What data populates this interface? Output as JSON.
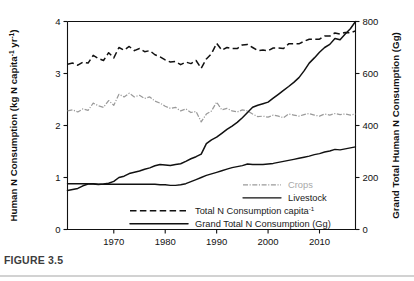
{
  "figure": {
    "caption_label": "FIGURE 3.5"
  },
  "chart_data": {
    "type": "line",
    "title": "",
    "xlabel": "",
    "ylabel": "Human N Consumption (kg N capita-1 yr-1)",
    "ylabel_main": "Human N Consumption (kg N capita",
    "ylabel_sup1": "-1",
    "ylabel_mid": " yr",
    "ylabel_sup2": "-1",
    "ylabel_end": ")",
    "y2label": "Grand Total Human N Consumption (Gg)",
    "xlim": [
      1961,
      2017
    ],
    "ylim": [
      0,
      4
    ],
    "y2lim": [
      0,
      800
    ],
    "xticks": [
      1970,
      1980,
      1990,
      2000,
      2010
    ],
    "yticks": [
      0,
      1,
      2,
      3,
      4
    ],
    "y2ticks": [
      0,
      200,
      400,
      600,
      800
    ],
    "grid": false,
    "legend_position": "inside-lower-right",
    "legend": [
      {
        "label": "Crops",
        "style": "dash-dot",
        "color": "#9a9a9a",
        "muted": true
      },
      {
        "label": "Livestock",
        "style": "solid",
        "color": "#111111",
        "muted": false
      },
      {
        "label": "Total N Consumption capita-1",
        "label_main": "Total N Consumption capita",
        "label_sup": "-1",
        "style": "dashed",
        "color": "#111111",
        "muted": false
      },
      {
        "label": "Grand Total N Consumption (Gg)",
        "label_main": "Grand Total N Consumption (Gg)",
        "label_sup": "",
        "style": "solid-thick",
        "color": "#111111",
        "muted": false
      }
    ],
    "x": [
      1961,
      1962,
      1963,
      1964,
      1965,
      1966,
      1967,
      1968,
      1969,
      1970,
      1971,
      1972,
      1973,
      1974,
      1975,
      1976,
      1977,
      1978,
      1979,
      1980,
      1981,
      1982,
      1983,
      1984,
      1985,
      1986,
      1987,
      1988,
      1989,
      1990,
      1991,
      1992,
      1993,
      1994,
      1995,
      1996,
      1997,
      1998,
      1999,
      2000,
      2001,
      2002,
      2003,
      2004,
      2005,
      2006,
      2007,
      2008,
      2009,
      2010,
      2011,
      2012,
      2013,
      2014,
      2015,
      2016,
      2017
    ],
    "series": [
      {
        "name": "Crops",
        "axis": "left",
        "unit": "kg N capita-1 yr-1",
        "values": [
          2.28,
          2.3,
          2.26,
          2.32,
          2.29,
          2.43,
          2.38,
          2.35,
          2.48,
          2.39,
          2.6,
          2.55,
          2.62,
          2.55,
          2.58,
          2.52,
          2.55,
          2.47,
          2.43,
          2.37,
          2.33,
          2.35,
          2.28,
          2.32,
          2.25,
          2.27,
          2.07,
          2.22,
          2.28,
          2.45,
          2.3,
          2.33,
          2.28,
          2.26,
          2.3,
          2.28,
          2.22,
          2.17,
          2.18,
          2.16,
          2.2,
          2.18,
          2.15,
          2.22,
          2.2,
          2.18,
          2.21,
          2.23,
          2.2,
          2.18,
          2.22,
          2.2,
          2.23,
          2.21,
          2.22,
          2.2,
          2.22
        ]
      },
      {
        "name": "Livestock",
        "axis": "left",
        "unit": "kg N capita-1 yr-1",
        "values": [
          0.88,
          0.88,
          0.88,
          0.88,
          0.88,
          0.88,
          0.87,
          0.87,
          0.87,
          0.87,
          0.87,
          0.87,
          0.87,
          0.87,
          0.87,
          0.87,
          0.87,
          0.87,
          0.86,
          0.86,
          0.85,
          0.85,
          0.86,
          0.88,
          0.92,
          0.96,
          1.0,
          1.04,
          1.07,
          1.1,
          1.13,
          1.16,
          1.19,
          1.21,
          1.23,
          1.26,
          1.25,
          1.25,
          1.25,
          1.26,
          1.27,
          1.29,
          1.31,
          1.33,
          1.35,
          1.37,
          1.39,
          1.41,
          1.44,
          1.46,
          1.49,
          1.51,
          1.54,
          1.53,
          1.55,
          1.57,
          1.59
        ]
      },
      {
        "name": "Total N Consumption capita-1",
        "axis": "left",
        "unit": "kg N capita-1 yr-1",
        "values": [
          3.18,
          3.2,
          3.16,
          3.22,
          3.2,
          3.35,
          3.29,
          3.25,
          3.4,
          3.3,
          3.5,
          3.45,
          3.52,
          3.44,
          3.48,
          3.42,
          3.44,
          3.36,
          3.32,
          3.26,
          3.22,
          3.23,
          3.17,
          3.22,
          3.19,
          3.25,
          3.1,
          3.28,
          3.38,
          3.58,
          3.45,
          3.5,
          3.48,
          3.48,
          3.55,
          3.56,
          3.5,
          3.44,
          3.45,
          3.44,
          3.49,
          3.49,
          3.48,
          3.57,
          3.57,
          3.57,
          3.62,
          3.66,
          3.66,
          3.66,
          3.72,
          3.72,
          3.78,
          3.76,
          3.79,
          3.78,
          3.82
        ]
      },
      {
        "name": "Grand Total N Consumption (Gg)",
        "axis": "right",
        "unit": "Gg",
        "values": [
          150,
          154,
          158,
          168,
          175,
          175,
          173,
          175,
          178,
          185,
          200,
          205,
          215,
          220,
          225,
          232,
          237,
          245,
          250,
          248,
          246,
          250,
          253,
          262,
          272,
          280,
          290,
          330,
          345,
          355,
          370,
          385,
          398,
          412,
          430,
          450,
          470,
          478,
          484,
          490,
          505,
          520,
          535,
          550,
          566,
          584,
          610,
          640,
          660,
          682,
          700,
          712,
          735,
          730,
          752,
          772,
          800
        ]
      }
    ]
  },
  "axes": {
    "left_ticks": [
      "0",
      "1",
      "2",
      "3",
      "4"
    ],
    "right_ticks": [
      "0",
      "200",
      "400",
      "600",
      "800"
    ],
    "bottom_ticks": [
      "1970",
      "1980",
      "1990",
      "2000",
      "2010"
    ]
  }
}
